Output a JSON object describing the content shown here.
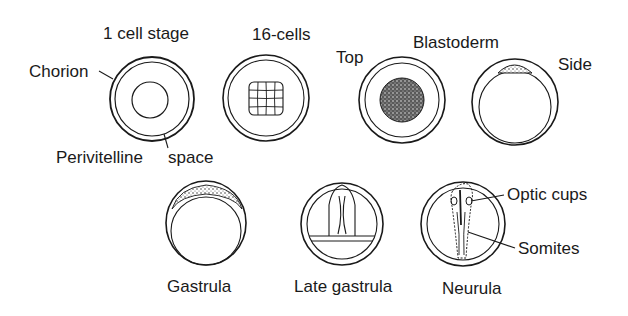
{
  "diagram": {
    "stages": [
      {
        "id": "one-cell",
        "label": "1 cell stage"
      },
      {
        "id": "sixteen-cells",
        "label": "16-cells"
      },
      {
        "id": "blastoderm",
        "label": "Blastoderm",
        "views": [
          {
            "label": "Top"
          },
          {
            "label": "Side"
          }
        ]
      },
      {
        "id": "gastrula",
        "label": "Gastrula"
      },
      {
        "id": "late-gastrula",
        "label": "Late gastrula"
      },
      {
        "id": "neurula",
        "label": "Neurula"
      }
    ],
    "annotations": {
      "chorion": "Chorion",
      "perivitelline_part1": "Perivitelline",
      "perivitelline_part2": "space",
      "optic_cups": "Optic cups",
      "somites": "Somites"
    },
    "colors": {
      "line": "#1a1a1a",
      "background": "#ffffff"
    }
  }
}
